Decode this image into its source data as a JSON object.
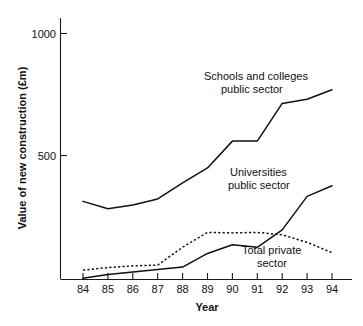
{
  "chart_data": {
    "type": "line",
    "title": "",
    "xlabel": "Year",
    "ylabel": "Value of new construction (£m)",
    "categories": [
      "84",
      "85",
      "86",
      "87",
      "88",
      "89",
      "90",
      "91",
      "92",
      "93",
      "94"
    ],
    "x": [
      84,
      85,
      86,
      87,
      88,
      89,
      90,
      91,
      92,
      93,
      94
    ],
    "xlim": [
      84,
      94
    ],
    "ylim": [
      0,
      1070
    ],
    "yticks": [
      500,
      1000
    ],
    "ytick_labels": [
      "500",
      "1000"
    ],
    "xtick_labels": [
      "84",
      "85",
      "86",
      "87",
      "88",
      "89",
      "90",
      "91",
      "92",
      "93",
      "94"
    ],
    "grid": false,
    "legend": "inline-annotations",
    "series": [
      {
        "name": "Schools and colleges public sector",
        "style": "solid",
        "values": [
          315,
          285,
          300,
          325,
          390,
          450,
          558,
          558,
          710,
          727,
          765
        ]
      },
      {
        "name": "Universities public sector",
        "style": "solid",
        "values": [
          5,
          20,
          30,
          40,
          50,
          105,
          140,
          130,
          200,
          335,
          378
        ]
      },
      {
        "name": "Total private sector",
        "style": "dotted",
        "values": [
          38,
          48,
          55,
          58,
          130,
          190,
          188,
          190,
          180,
          150,
          108
        ]
      }
    ],
    "annotations": [
      {
        "id": "schools-label",
        "line1": "Schools and colleges",
        "line2": "public sector"
      },
      {
        "id": "universities-label",
        "line1": "Universities",
        "line2": "public sector"
      },
      {
        "id": "private-label",
        "line1": "Total private",
        "line2": "sector"
      }
    ],
    "colors": {
      "axis": "#1a1a1a",
      "line": "#111111",
      "background": "#ffffff"
    }
  }
}
